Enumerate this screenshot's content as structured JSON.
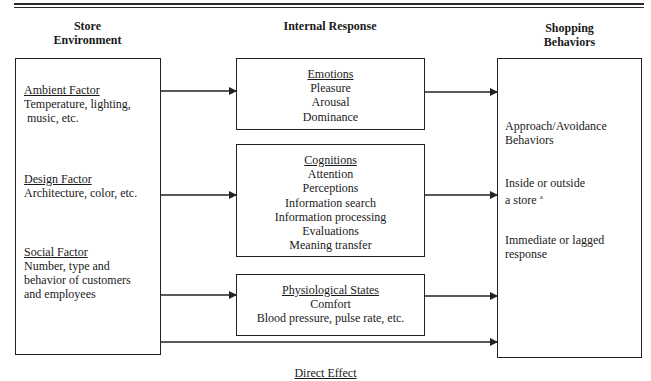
{
  "headers": {
    "left": [
      "Store",
      "Environment"
    ],
    "middle": "Internal Response",
    "right": [
      "Shopping",
      "Behaviors"
    ]
  },
  "store_environment": {
    "factors": [
      {
        "title": "Ambient Factor",
        "lines": [
          "Temperature, lighting,",
          " music, etc."
        ]
      },
      {
        "title": "Design Factor",
        "lines": [
          "Architecture, color, etc."
        ]
      },
      {
        "title": "Social Factor",
        "lines": [
          "Number, type and",
          "behavior of customers",
          "and employees"
        ]
      }
    ]
  },
  "internal_response": {
    "emotions": {
      "title": "Emotions",
      "items": [
        "Pleasure",
        "Arousal",
        "Dominance"
      ]
    },
    "cognitions": {
      "title": "Cognitions",
      "items": [
        "Attention",
        "Perceptions",
        "Information search",
        "Information processing",
        "Evaluations",
        "Meaning transfer"
      ]
    },
    "physiological": {
      "title": "Physiological States",
      "items": [
        "Comfort",
        "Blood pressure, pulse rate, etc."
      ]
    }
  },
  "shopping_behaviors": {
    "items": [
      {
        "lines": [
          "Approach/Avoidance",
          "Behaviors"
        ]
      },
      {
        "lines": [
          "Inside or outside",
          "a store"
        ],
        "superscript": "a"
      },
      {
        "lines": [
          "Immediate or lagged",
          "response"
        ]
      }
    ]
  },
  "direct_effect_label": "Direct Effect",
  "colors": {
    "line": "#222222",
    "text": "#1a1a1a",
    "background": "#ffffff"
  }
}
